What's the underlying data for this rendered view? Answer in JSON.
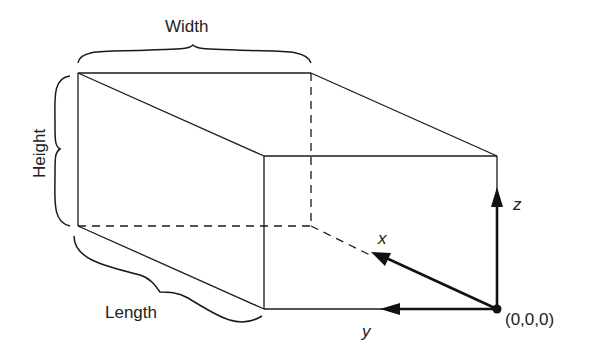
{
  "figure": {
    "type": "rectangular-prism-coordinate-diagram",
    "dimension_labels": {
      "width": "Width",
      "height": "Height",
      "length": "Length"
    },
    "axis_labels": {
      "x": "x",
      "y": "y",
      "z": "z"
    },
    "origin_label": "(0,0,0)",
    "colors": {
      "line": "#1a1a1a",
      "background": "#ffffff",
      "text": "#222222"
    }
  }
}
